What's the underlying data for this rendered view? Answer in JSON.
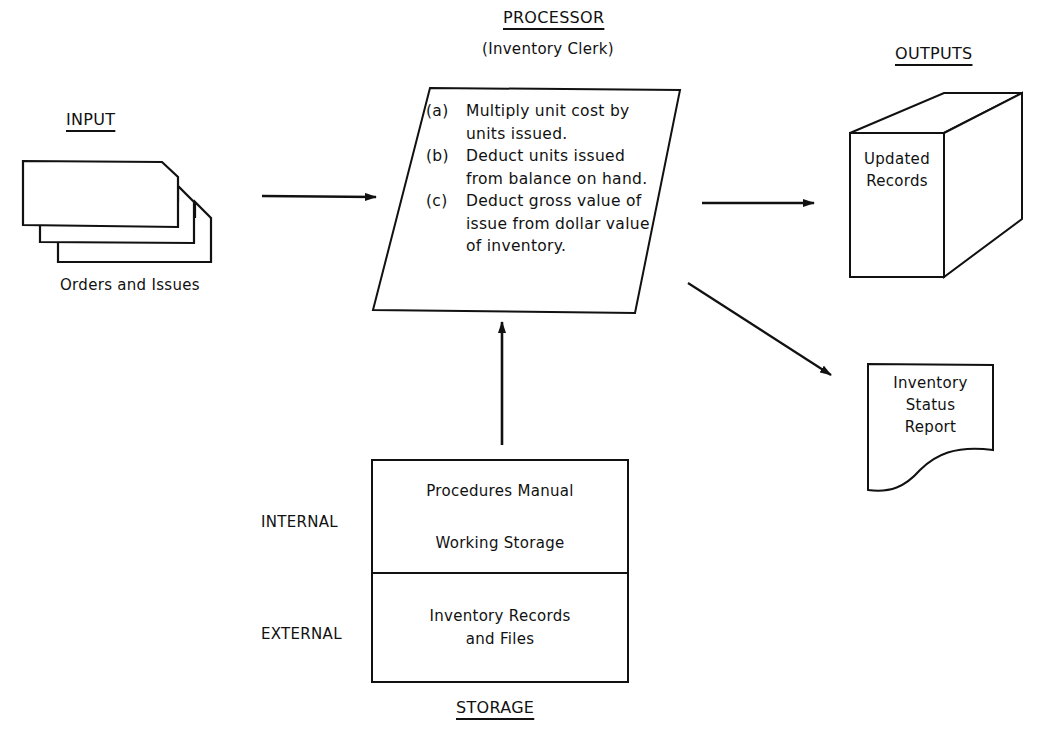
{
  "input": {
    "heading": "INPUT",
    "document_label": "Orders and Issues"
  },
  "processor": {
    "heading": "PROCESSOR",
    "subheading": "(Inventory Clerk)",
    "steps": [
      {
        "tag": "(a)",
        "text": "Multiply unit cost by units issued."
      },
      {
        "tag": "(b)",
        "text": "Deduct units issued from balance on hand."
      },
      {
        "tag": "(c)",
        "text": "Deduct gross value of issue from dollar value of inventory."
      }
    ]
  },
  "outputs": {
    "heading": "OUTPUTS",
    "file_label_line1": "Updated",
    "file_label_line2": "Records",
    "report_line1": "Inventory",
    "report_line2": "Status",
    "report_line3": "Report"
  },
  "storage": {
    "heading": "STORAGE",
    "internal_label": "INTERNAL",
    "external_label": "EXTERNAL",
    "internal_line1": "Procedures Manual",
    "internal_line2": "Working Storage",
    "external_line1": "Inventory Records",
    "external_line2": "and Files"
  },
  "colors": {
    "stroke": "#111111",
    "background": "#ffffff"
  }
}
